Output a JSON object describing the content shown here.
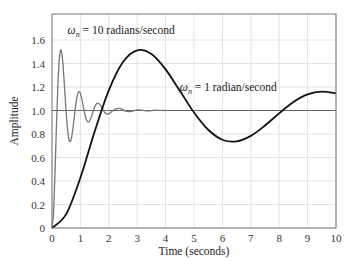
{
  "chart_data": {
    "type": "line",
    "title": "",
    "xlabel": "Time (seconds)",
    "ylabel": "Amplitude",
    "xlim": [
      0,
      10
    ],
    "ylim": [
      0,
      1.8
    ],
    "grid": true,
    "x_ticks": [
      "0",
      "1",
      "2",
      "3",
      "4",
      "5",
      "6",
      "7",
      "8",
      "9",
      "10"
    ],
    "y_ticks": [
      "0",
      "0.2",
      "0.4",
      "0.6",
      "0.8",
      "1.0",
      "1.2",
      "1.4",
      "1.6"
    ],
    "reference_line": {
      "y": 1.0,
      "color": "#666666"
    },
    "series": [
      {
        "name": "ωn = 1 radian/second",
        "label_prefix": "ω",
        "label_sub": "n",
        "label_suffix": " = 1 radian/second",
        "color": "#111111",
        "width": 1.8,
        "x": [
          0,
          0.5,
          1,
          1.5,
          2,
          2.5,
          3,
          3.5,
          4,
          4.5,
          5,
          5.5,
          6,
          6.5,
          7,
          7.5,
          8,
          8.5,
          9,
          9.5,
          10
        ],
        "values": [
          0,
          0.118,
          0.428,
          0.819,
          1.171,
          1.412,
          1.512,
          1.48,
          1.35,
          1.168,
          0.983,
          0.836,
          0.751,
          0.737,
          0.784,
          0.872,
          0.976,
          1.072,
          1.137,
          1.161,
          1.145
        ]
      },
      {
        "name": "ωn = 10 radians/second",
        "label_prefix": "ω",
        "label_sub": "n",
        "label_suffix": " = 10 radians/second",
        "color": "#777777",
        "width": 1.3,
        "x": [
          0,
          0.05,
          0.1,
          0.15,
          0.2,
          0.25,
          0.3,
          0.35,
          0.4,
          0.45,
          0.5,
          0.55,
          0.6,
          0.65,
          0.7,
          0.75,
          0.8,
          0.85,
          0.9,
          0.95,
          1.0,
          1.05,
          1.1,
          1.15,
          1.2,
          1.25,
          1.3,
          1.35,
          1.4,
          1.45,
          1.5,
          1.55,
          1.6,
          1.65,
          1.7,
          1.75,
          1.8,
          1.85,
          1.9,
          1.95,
          2.0,
          2.2,
          2.4,
          2.6,
          2.8,
          3.0,
          3.2,
          3.4,
          3.6,
          3.8,
          4.0
        ],
        "values": [
          0,
          0.118,
          0.428,
          0.819,
          1.171,
          1.412,
          1.512,
          1.48,
          1.35,
          1.168,
          0.983,
          0.836,
          0.751,
          0.737,
          0.784,
          0.872,
          0.976,
          1.072,
          1.137,
          1.161,
          1.145,
          1.098,
          1.036,
          0.976,
          0.93,
          0.906,
          0.905,
          0.924,
          0.956,
          0.993,
          1.027,
          1.052,
          1.063,
          1.06,
          1.046,
          1.026,
          1.004,
          0.985,
          0.973,
          0.969,
          0.972,
          1.008,
          1.018,
          0.994,
          0.993,
          1.006,
          1.001,
          0.997,
          1.002,
          1.001,
          1.0
        ]
      }
    ],
    "annotations": [
      {
        "series": 1,
        "x": 0.55,
        "y": 1.65
      },
      {
        "series": 0,
        "x": 4.5,
        "y": 1.17
      }
    ]
  }
}
